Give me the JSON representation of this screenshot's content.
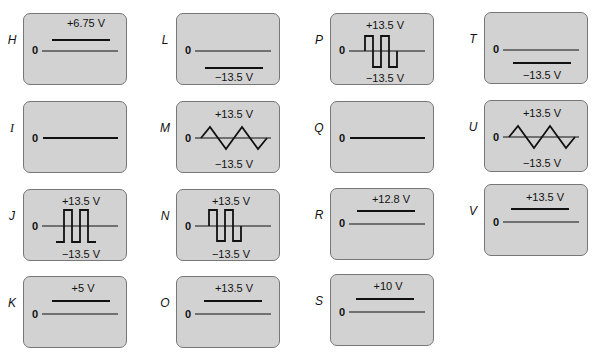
{
  "figure": {
    "zero_label": "0",
    "colors": {
      "panel_background": "#d2d2d2",
      "panel_border": "#777777",
      "trace": "#111111"
    },
    "panels": [
      {
        "id": "H",
        "label": "H",
        "type": "dc",
        "top_label": "+6.75 V",
        "bottom_label": ""
      },
      {
        "id": "L",
        "label": "L",
        "type": "dc",
        "top_label": "",
        "bottom_label": "−13.5 V"
      },
      {
        "id": "P",
        "label": "P",
        "type": "square_bipolar",
        "top_label": "+13.5 V",
        "bottom_label": "−13.5 V"
      },
      {
        "id": "T",
        "label": "T",
        "type": "dc",
        "top_label": "",
        "bottom_label": "−13.5 V"
      },
      {
        "id": "I",
        "label": "I",
        "type": "zero",
        "top_label": "",
        "bottom_label": ""
      },
      {
        "id": "M",
        "label": "M",
        "type": "triangle",
        "top_label": "+13.5 V",
        "bottom_label": "−13.5 V"
      },
      {
        "id": "Q",
        "label": "Q",
        "type": "zero",
        "top_label": "",
        "bottom_label": ""
      },
      {
        "id": "U",
        "label": "U",
        "type": "triangle",
        "top_label": "+13.5 V",
        "bottom_label": "−13.5 V"
      },
      {
        "id": "J",
        "label": "J",
        "type": "square_pulses",
        "top_label": "+13.5 V",
        "bottom_label": "−13.5 V"
      },
      {
        "id": "N",
        "label": "N",
        "type": "square_bipolar",
        "top_label": "+13.5 V",
        "bottom_label": "−13.5 V"
      },
      {
        "id": "R",
        "label": "R",
        "type": "dc",
        "top_label": "+12.8 V",
        "bottom_label": ""
      },
      {
        "id": "V",
        "label": "V",
        "type": "dc",
        "top_label": "+13.5 V",
        "bottom_label": ""
      },
      {
        "id": "K",
        "label": "K",
        "type": "dc",
        "top_label": "+5 V",
        "bottom_label": ""
      },
      {
        "id": "O",
        "label": "O",
        "type": "dc",
        "top_label": "+13.5 V",
        "bottom_label": ""
      },
      {
        "id": "S",
        "label": "S",
        "type": "dc",
        "top_label": "+10 V",
        "bottom_label": ""
      }
    ]
  }
}
